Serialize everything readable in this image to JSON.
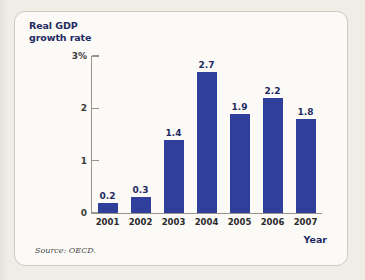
{
  "chart_data": {
    "type": "bar",
    "title": "",
    "categories": [
      "2001",
      "2002",
      "2003",
      "2004",
      "2005",
      "2006",
      "2007"
    ],
    "values": [
      0.2,
      0.3,
      1.4,
      2.7,
      1.9,
      2.2,
      1.8
    ],
    "value_labels": [
      "0.2",
      "0.3",
      "1.4",
      "2.7",
      "1.9",
      "2.2",
      "1.8"
    ],
    "xlabel": "Year",
    "ylabel": "Real GDP growth rate",
    "ylim": [
      0,
      3
    ],
    "yticks": [
      0,
      1,
      2,
      3
    ],
    "ytick_labels": [
      "0",
      "1",
      "2",
      "3%"
    ],
    "grid": false,
    "legend": false,
    "bar_color": "#2f3f9b",
    "axis_color": "#9a958c",
    "source": "Source: OECD."
  },
  "axis_title": {
    "y_line1": "Real GDP",
    "y_line2": "growth rate",
    "x": "Year"
  },
  "footer": {
    "source": "Source: OECD."
  }
}
